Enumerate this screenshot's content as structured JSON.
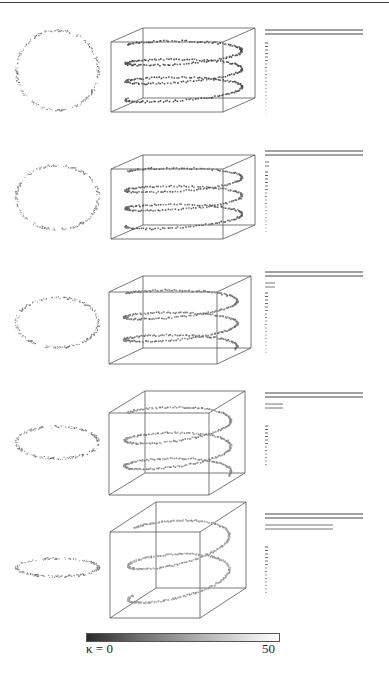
{
  "figure": {
    "rows": [
      {
        "id": "row1",
        "ellipse": {
          "cx": 57,
          "cy": 70,
          "rx": 41,
          "ry": 40
        },
        "box_center": [
          183,
          70
        ],
        "box_w": 112,
        "box_h": 70,
        "box_depth": [
          32,
          -14
        ],
        "turns": 3,
        "spectrum": {
          "long_bars": 2,
          "long_len": 98,
          "short_bars": 0,
          "short_len": 0,
          "ticks": 22
        }
      },
      {
        "id": "row2",
        "ellipse": {
          "cx": 57,
          "cy": 197,
          "rx": 41,
          "ry": 32
        },
        "box_center": [
          183,
          197
        ],
        "box_w": 112,
        "box_h": 70,
        "box_depth": [
          32,
          -14
        ],
        "turns": 3,
        "spectrum": {
          "long_bars": 2,
          "long_len": 98,
          "short_bars": 2,
          "short_len": 4,
          "ticks": 18
        }
      },
      {
        "id": "row3",
        "ellipse": {
          "cx": 57,
          "cy": 322,
          "rx": 41,
          "ry": 25
        },
        "box_center": [
          180,
          320
        ],
        "box_w": 108,
        "box_h": 72,
        "box_depth": [
          34,
          -16
        ],
        "turns": 2.5,
        "spectrum": {
          "long_bars": 2,
          "long_len": 98,
          "short_bars": 2,
          "short_len": 10,
          "ticks": 18
        }
      },
      {
        "id": "row4",
        "ellipse": {
          "cx": 57,
          "cy": 442,
          "rx": 41,
          "ry": 16
        },
        "box_center": [
          177,
          443
        ],
        "box_w": 100,
        "box_h": 82,
        "box_depth": [
          36,
          -22
        ],
        "turns": 2.5,
        "spectrum": {
          "long_bars": 2,
          "long_len": 98,
          "short_bars": 2,
          "short_len": 18,
          "ticks": 12
        }
      },
      {
        "id": "row5",
        "ellipse": {
          "cx": 57,
          "cy": 567,
          "rx": 41,
          "ry": 9
        },
        "box_center": [
          178,
          560
        ],
        "box_w": 90,
        "box_h": 86,
        "box_depth": [
          46,
          -30
        ],
        "turns": 2,
        "spectrum": {
          "long_bars": 2,
          "long_len": 98,
          "short_bars": 2,
          "short_len": 68,
          "ticks": 14
        }
      }
    ],
    "spectrum_origin_x": 265,
    "spectrum_row_tops": [
      30,
      151,
      272,
      393,
      514
    ]
  },
  "colorbar": {
    "label_min": "κ = 0",
    "label_max": "50",
    "min": 0,
    "max": 50
  }
}
